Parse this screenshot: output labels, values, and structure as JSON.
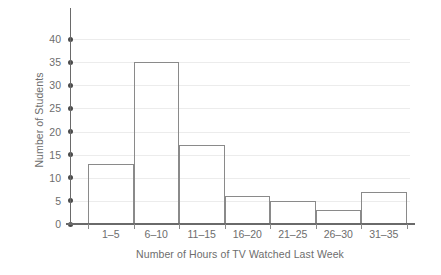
{
  "chart_data": {
    "type": "bar",
    "title": "",
    "xlabel": "Number of Hours of TV Watched Last Week",
    "ylabel": "Number of Students",
    "categories": [
      "1–5",
      "6–10",
      "11–15",
      "16–20",
      "21–25",
      "26–30",
      "31–35"
    ],
    "values": [
      13,
      35,
      17,
      6,
      5,
      3,
      7
    ],
    "ylim": [
      0,
      45
    ],
    "yticks": [
      0,
      5,
      10,
      15,
      20,
      25,
      30,
      35,
      40
    ],
    "ytick_labels": [
      "0",
      "5",
      "10",
      "15",
      "20",
      "25",
      "30",
      "35",
      "40"
    ],
    "grid": true,
    "legend": false,
    "colors": {
      "bar_edge": "#8a8a8a",
      "bar_fill": "#ffffff",
      "gridline": "#ececec",
      "axis": "#6a6a6a",
      "text": "#6d6d6d",
      "tick_marker": "#4a4a4a"
    }
  },
  "axes": {
    "y": {
      "title": "Number of Students",
      "ticks": [
        {
          "value": 0,
          "label": "0"
        },
        {
          "value": 5,
          "label": "5"
        },
        {
          "value": 10,
          "label": "10"
        },
        {
          "value": 15,
          "label": "15"
        },
        {
          "value": 20,
          "label": "20"
        },
        {
          "value": 25,
          "label": "25"
        },
        {
          "value": 30,
          "label": "30"
        },
        {
          "value": 35,
          "label": "35"
        },
        {
          "value": 40,
          "label": "40"
        }
      ]
    },
    "x": {
      "title": "Number of Hours of TV Watched Last Week",
      "ticks": [
        {
          "label": "1–5"
        },
        {
          "label": "6–10"
        },
        {
          "label": "11–15"
        },
        {
          "label": "16–20"
        },
        {
          "label": "21–25"
        },
        {
          "label": "26–30"
        },
        {
          "label": "31–35"
        }
      ]
    }
  }
}
